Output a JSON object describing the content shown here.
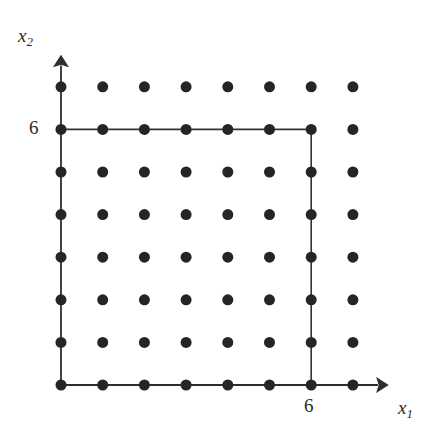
{
  "figure": {
    "title": "",
    "background_color": "#ffffff",
    "width": 444,
    "height": 438
  },
  "labels": {
    "y_axis": "x",
    "y_axis_sub": "2",
    "x_axis": "x",
    "x_axis_sub": "1",
    "y_tick_6": "6",
    "x_tick_6": "6"
  },
  "chart_data": {
    "type": "scatter",
    "title": "",
    "xlabel": "x1",
    "ylabel": "x2",
    "xlim": [
      0,
      7
    ],
    "ylim": [
      0,
      7
    ],
    "grid": false,
    "legend": "none",
    "xticks": [
      6
    ],
    "xticklabels": [
      "6"
    ],
    "yticks": [
      6
    ],
    "yticklabels": [
      "6"
    ],
    "point_color": "#252525",
    "line_color": "#333333",
    "point_radius_px": 5.5,
    "lattice_x": [
      0,
      1,
      2,
      3,
      4,
      5,
      6,
      7
    ],
    "lattice_y": [
      0,
      1,
      2,
      3,
      4,
      5,
      6,
      7
    ],
    "points": [
      {
        "x": 0,
        "y": 0
      },
      {
        "x": 1,
        "y": 0
      },
      {
        "x": 2,
        "y": 0
      },
      {
        "x": 3,
        "y": 0
      },
      {
        "x": 4,
        "y": 0
      },
      {
        "x": 5,
        "y": 0
      },
      {
        "x": 6,
        "y": 0
      },
      {
        "x": 7,
        "y": 0
      },
      {
        "x": 0,
        "y": 1
      },
      {
        "x": 1,
        "y": 1
      },
      {
        "x": 2,
        "y": 1
      },
      {
        "x": 3,
        "y": 1
      },
      {
        "x": 4,
        "y": 1
      },
      {
        "x": 5,
        "y": 1
      },
      {
        "x": 6,
        "y": 1
      },
      {
        "x": 7,
        "y": 1
      },
      {
        "x": 0,
        "y": 2
      },
      {
        "x": 1,
        "y": 2
      },
      {
        "x": 2,
        "y": 2
      },
      {
        "x": 3,
        "y": 2
      },
      {
        "x": 4,
        "y": 2
      },
      {
        "x": 5,
        "y": 2
      },
      {
        "x": 6,
        "y": 2
      },
      {
        "x": 7,
        "y": 2
      },
      {
        "x": 0,
        "y": 3
      },
      {
        "x": 1,
        "y": 3
      },
      {
        "x": 2,
        "y": 3
      },
      {
        "x": 3,
        "y": 3
      },
      {
        "x": 4,
        "y": 3
      },
      {
        "x": 5,
        "y": 3
      },
      {
        "x": 6,
        "y": 3
      },
      {
        "x": 7,
        "y": 3
      },
      {
        "x": 0,
        "y": 4
      },
      {
        "x": 1,
        "y": 4
      },
      {
        "x": 2,
        "y": 4
      },
      {
        "x": 3,
        "y": 4
      },
      {
        "x": 4,
        "y": 4
      },
      {
        "x": 5,
        "y": 4
      },
      {
        "x": 6,
        "y": 4
      },
      {
        "x": 7,
        "y": 4
      },
      {
        "x": 0,
        "y": 5
      },
      {
        "x": 1,
        "y": 5
      },
      {
        "x": 2,
        "y": 5
      },
      {
        "x": 3,
        "y": 5
      },
      {
        "x": 4,
        "y": 5
      },
      {
        "x": 5,
        "y": 5
      },
      {
        "x": 6,
        "y": 5
      },
      {
        "x": 7,
        "y": 5
      },
      {
        "x": 0,
        "y": 6
      },
      {
        "x": 1,
        "y": 6
      },
      {
        "x": 2,
        "y": 6
      },
      {
        "x": 3,
        "y": 6
      },
      {
        "x": 4,
        "y": 6
      },
      {
        "x": 5,
        "y": 6
      },
      {
        "x": 6,
        "y": 6
      },
      {
        "x": 7,
        "y": 6
      },
      {
        "x": 0,
        "y": 7
      },
      {
        "x": 1,
        "y": 7
      },
      {
        "x": 2,
        "y": 7
      },
      {
        "x": 3,
        "y": 7
      },
      {
        "x": 4,
        "y": 7
      },
      {
        "x": 5,
        "y": 7
      },
      {
        "x": 6,
        "y": 7
      },
      {
        "x": 7,
        "y": 7
      }
    ],
    "region_box": {
      "x_min": 0,
      "y_min": 0,
      "x_max": 6,
      "y_max": 6
    },
    "axes": {
      "x_arrow_to": 7.6,
      "y_arrow_to": 7.5,
      "origin_px": [
        61,
        385
      ],
      "x_spacing_px": 41.7,
      "y_spacing_px": 42.6
    }
  }
}
